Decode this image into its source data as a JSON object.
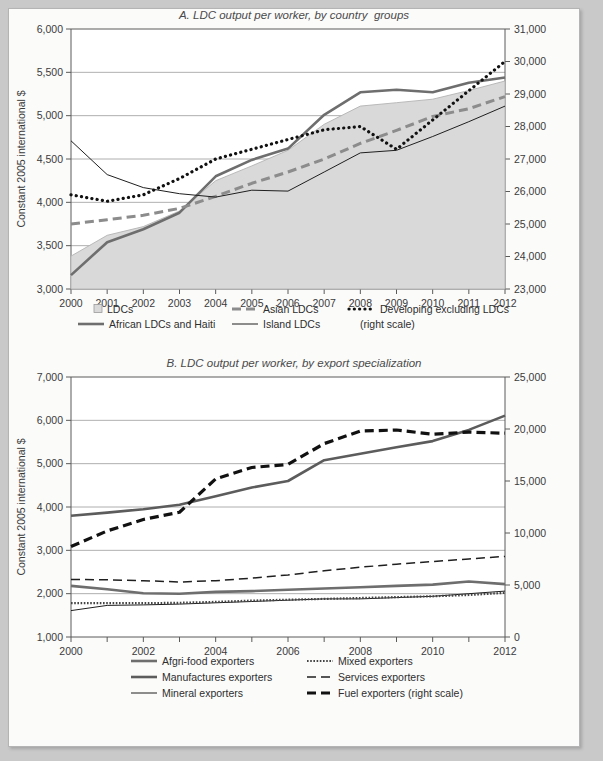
{
  "page": {
    "background_color": "#c9c9c9",
    "sheet_color": "#fbfbfa"
  },
  "panel_a": {
    "title": "A. LDC output per worker, by country  groups",
    "ylabel_left": "Constant 2005 international $",
    "legend": [
      {
        "label": "LDCs",
        "style": "area",
        "color": "#d9d9d9"
      },
      {
        "label": "African LDCs and Haiti",
        "style": "thick-solid",
        "color": "#6e6e6e"
      },
      {
        "label": "Asian LDCs",
        "style": "thick-dash",
        "color": "#8c8c8c"
      },
      {
        "label": "Island LDCs",
        "style": "thin-solid",
        "color": "#1f1f1f"
      },
      {
        "label": "Developing excluding LDCs",
        "style": "dotted",
        "color": "#111111"
      },
      {
        "label": "(right scale)",
        "style": "none",
        "color": "#111111"
      }
    ]
  },
  "panel_b": {
    "title": "B. LDC output per worker, by export specialization",
    "ylabel_left": "Constant 2005 international $",
    "legend": [
      {
        "label": "Afgri-food exporters",
        "style": "thick-solid",
        "color": "#6e6e6e"
      },
      {
        "label": "Mixed exporters",
        "style": "fine-dotted",
        "color": "#444444"
      },
      {
        "label": "Manufactures exporters",
        "style": "thick-dash-short",
        "color": "#5c5c5c"
      },
      {
        "label": "Services exporters",
        "style": "long-dash",
        "color": "#1f1f1f"
      },
      {
        "label": "Mineral exporters",
        "style": "thin-solid",
        "color": "#1f1f1f"
      },
      {
        "label": "Fuel exporters (right scale)",
        "style": "heavy-dash",
        "color": "#111111"
      }
    ]
  },
  "chart_data": [
    {
      "id": "panel_a",
      "type": "line",
      "title": "A. LDC output per worker, by country  groups",
      "xlabel": "",
      "ylabel": "Constant 2005 international $",
      "x": [
        2000,
        2001,
        2002,
        2003,
        2004,
        2005,
        2006,
        2007,
        2008,
        2009,
        2010,
        2011,
        2012
      ],
      "xlim": [
        2000,
        2012
      ],
      "ylim": [
        3000,
        6000
      ],
      "yticks": [
        3000,
        3500,
        4000,
        4500,
        5000,
        5500,
        6000
      ],
      "ytick_labels": [
        "3,000",
        "3,500",
        "4,000",
        "4,500",
        "5,000",
        "5,500",
        "6,000"
      ],
      "y2lim": [
        23000,
        31000
      ],
      "y2ticks": [
        23000,
        24000,
        25000,
        26000,
        27000,
        28000,
        29000,
        30000,
        31000
      ],
      "y2tick_labels": [
        "23,000",
        "24,000",
        "25,000",
        "26,000",
        "27,000",
        "28,000",
        "29,000",
        "30,000",
        "31,000"
      ],
      "xtick_labels": [
        "2000",
        "2001",
        "2002",
        "2003",
        "2004",
        "2005",
        "2006",
        "2007",
        "2008",
        "2009",
        "2010",
        "2011",
        "2012"
      ],
      "grid": true,
      "legend_position": "bottom",
      "series": [
        {
          "name": "LDCs",
          "style": "area",
          "axis": "left",
          "color": "#d9d9d9",
          "values": [
            3380,
            3620,
            3720,
            3900,
            4250,
            4420,
            4600,
            4900,
            5110,
            5150,
            5190,
            5290,
            5400
          ]
        },
        {
          "name": "African LDCs and Haiti",
          "style": "thick-solid",
          "axis": "left",
          "color": "#6e6e6e",
          "values": [
            3160,
            3540,
            3690,
            3880,
            4300,
            4490,
            4620,
            5010,
            5270,
            5300,
            5270,
            5380,
            5440
          ]
        },
        {
          "name": "Asian LDCs",
          "style": "thick-dash",
          "axis": "left",
          "color": "#8c8c8c",
          "values": [
            3750,
            3800,
            3850,
            3930,
            4070,
            4220,
            4350,
            4500,
            4680,
            4830,
            4990,
            5080,
            5220
          ]
        },
        {
          "name": "Island LDCs",
          "style": "thin-solid",
          "axis": "left",
          "color": "#1f1f1f",
          "values": [
            4710,
            4320,
            4170,
            4100,
            4060,
            4140,
            4130,
            4350,
            4570,
            4600,
            4760,
            4930,
            5110
          ]
        },
        {
          "name": "Developing excluding LDCs",
          "style": "dotted",
          "axis": "right",
          "color": "#111111",
          "values": [
            25900,
            25700,
            25900,
            26400,
            27000,
            27300,
            27600,
            27900,
            28000,
            27300,
            28200,
            29100,
            30000
          ]
        }
      ]
    },
    {
      "id": "panel_b",
      "type": "line",
      "title": "B. LDC output per worker, by export specialization",
      "xlabel": "",
      "ylabel": "Constant 2005 international $",
      "x": [
        2000,
        2001,
        2002,
        2003,
        2004,
        2005,
        2006,
        2007,
        2008,
        2009,
        2010,
        2011,
        2012
      ],
      "xlim": [
        2000,
        2012
      ],
      "ylim": [
        1000,
        7000
      ],
      "yticks": [
        1000,
        2000,
        3000,
        4000,
        5000,
        6000,
        7000
      ],
      "ytick_labels": [
        "1,000",
        "2,000",
        "3,000",
        "4,000",
        "5,000",
        "6,000",
        "7,000"
      ],
      "y2lim": [
        0,
        25000
      ],
      "y2ticks": [
        0,
        5000,
        10000,
        15000,
        20000,
        25000
      ],
      "y2tick_labels": [
        "0",
        "5,000",
        "10,000",
        "15,000",
        "20,000",
        "25,000"
      ],
      "xtick_labels": [
        "2000",
        "",
        "2002",
        "",
        "2004",
        "",
        "2006",
        "",
        "2008",
        "",
        "2010",
        "",
        "2012"
      ],
      "grid": true,
      "legend_position": "bottom",
      "series": [
        {
          "name": "Afgri-food exporters",
          "style": "thick-solid",
          "axis": "left",
          "color": "#6e6e6e",
          "values": [
            2180,
            2100,
            2010,
            2000,
            2040,
            2060,
            2090,
            2120,
            2150,
            2180,
            2210,
            2280,
            2220
          ]
        },
        {
          "name": "Manufactures exporters",
          "style": "thick-dash-short",
          "axis": "left",
          "color": "#5c5c5c",
          "values": [
            3800,
            3870,
            3950,
            4050,
            4250,
            4450,
            4600,
            5080,
            5230,
            5380,
            5520,
            5780,
            6110
          ]
        },
        {
          "name": "Mineral exporters",
          "style": "thin-solid",
          "axis": "left",
          "color": "#1f1f1f",
          "values": [
            1610,
            1730,
            1740,
            1760,
            1790,
            1820,
            1850,
            1880,
            1880,
            1910,
            1940,
            2000,
            2060
          ]
        },
        {
          "name": "Mixed exporters",
          "style": "fine-dotted",
          "axis": "left",
          "color": "#444444",
          "values": [
            1780,
            1780,
            1780,
            1790,
            1810,
            1840,
            1860,
            1880,
            1900,
            1920,
            1940,
            1970,
            2020
          ]
        },
        {
          "name": "Services exporters",
          "style": "long-dash",
          "axis": "left",
          "color": "#1f1f1f",
          "values": [
            2330,
            2320,
            2300,
            2270,
            2300,
            2360,
            2430,
            2530,
            2610,
            2680,
            2740,
            2800,
            2860
          ]
        },
        {
          "name": "Fuel exporters (right scale)",
          "style": "heavy-dash",
          "axis": "right",
          "color": "#111111",
          "values": [
            8700,
            10200,
            11300,
            12000,
            15200,
            16300,
            16600,
            18600,
            19800,
            19900,
            19500,
            19700,
            19600
          ]
        }
      ]
    }
  ]
}
